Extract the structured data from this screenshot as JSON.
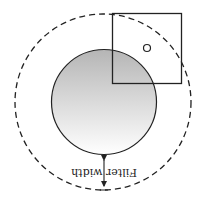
{
  "diagram": {
    "orientation": "rotated 180 degrees",
    "label": "Filter width",
    "colors": {
      "stroke": "#222222",
      "fill_top": "#b5b5b5",
      "fill_bottom": "#ffffff",
      "background": "#ffffff"
    },
    "elements": {
      "outer_circle": "dashed filter boundary",
      "inner_circle": "shaded object",
      "square": "pixel window",
      "small_circle": "sample point",
      "arrow": "double-headed arrow indicating filter width"
    }
  }
}
